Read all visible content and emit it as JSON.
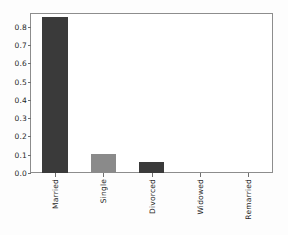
{
  "chart_data": {
    "type": "bar",
    "title": "",
    "subtitle": "",
    "xlabel": "",
    "ylabel": "",
    "categories": [
      "Married",
      "Single",
      "Divorced",
      "Widowed",
      "Remarried"
    ],
    "values": [
      0.855,
      0.105,
      0.06,
      0.0,
      0.0
    ],
    "series": [
      {
        "name": "",
        "values": [
          0.855,
          0.105,
          0.06,
          0.0,
          0.0
        ]
      }
    ],
    "bar_colors": [
      "#3a3a3a",
      "#8a8a8a",
      "#3a3a3a",
      "#3a3a3a",
      "#3a3a3a"
    ],
    "ylim": [
      0.0,
      0.87
    ],
    "xlim": [
      0,
      5
    ],
    "ytick_labels": [
      "0.0",
      "0.1",
      "0.2",
      "0.3",
      "0.4",
      "0.5",
      "0.6",
      "0.7",
      "0.8"
    ],
    "ytick_values": [
      0.0,
      0.1,
      0.2,
      0.3,
      0.4,
      0.5,
      0.6,
      0.7,
      0.8
    ],
    "grid": false,
    "legend": false,
    "legend_position": "none",
    "xtick_label_rotation": 90,
    "frame_color": "#8d8d8d",
    "background_color": "#ffffff",
    "figure_background_color": "#fdfdfd",
    "tick_color": "#6f6f6f",
    "text_color": "#1f1f1f"
  }
}
